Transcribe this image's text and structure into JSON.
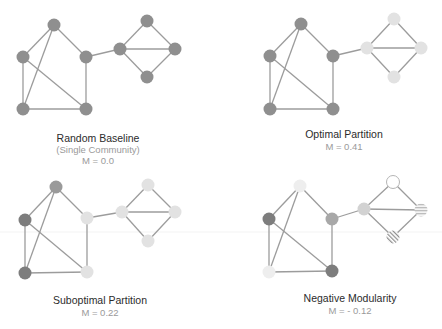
{
  "colors": {
    "edge": "#9c9c9c",
    "dark": "#7d7d7d",
    "base": "#8f8f8f",
    "medium": "#a8a8a8",
    "light": "#dcdcdc",
    "pale": "#ececec",
    "white": "#ffffff"
  },
  "panels": [
    {
      "id": "random-baseline",
      "title": "Random Baseline",
      "subtitle": "(Single Community)",
      "metric": "M = 0.0",
      "label_x": 98,
      "title_y": 142,
      "subtitle_y": 153,
      "metric_y": 164,
      "nodes": [
        {
          "x": 54,
          "y": 25,
          "fill": "#8f8f8f"
        },
        {
          "x": 23,
          "y": 57,
          "fill": "#8f8f8f"
        },
        {
          "x": 86,
          "y": 57,
          "fill": "#8f8f8f"
        },
        {
          "x": 23,
          "y": 109,
          "fill": "#8f8f8f"
        },
        {
          "x": 86,
          "y": 109,
          "fill": "#8f8f8f"
        },
        {
          "x": 120,
          "y": 49,
          "fill": "#8f8f8f"
        },
        {
          "x": 147,
          "y": 21,
          "fill": "#8f8f8f"
        },
        {
          "x": 175,
          "y": 49,
          "fill": "#8f8f8f"
        },
        {
          "x": 147,
          "y": 77,
          "fill": "#8f8f8f"
        }
      ]
    },
    {
      "id": "optimal-partition",
      "title": "Optimal Partition",
      "subtitle": "",
      "metric": "M = 0.41",
      "label_x": 344,
      "title_y": 138,
      "subtitle_y": 0,
      "metric_y": 150,
      "nodes": [
        {
          "x": 301,
          "y": 24,
          "fill": "#8f8f8f"
        },
        {
          "x": 270,
          "y": 56,
          "fill": "#8f8f8f"
        },
        {
          "x": 333,
          "y": 56,
          "fill": "#8f8f8f"
        },
        {
          "x": 270,
          "y": 109,
          "fill": "#8f8f8f"
        },
        {
          "x": 333,
          "y": 109,
          "fill": "#8f8f8f"
        },
        {
          "x": 367,
          "y": 48,
          "fill": "#e2e2e2"
        },
        {
          "x": 394,
          "y": 19,
          "fill": "#e2e2e2"
        },
        {
          "x": 421,
          "y": 48,
          "fill": "#e2e2e2"
        },
        {
          "x": 394,
          "y": 77,
          "fill": "#e2e2e2"
        }
      ]
    },
    {
      "id": "suboptimal-partition",
      "title": "Suboptimal Partition",
      "subtitle": "",
      "metric": "M = 0.22",
      "label_x": 100,
      "title_y": 304,
      "subtitle_y": 0,
      "metric_y": 316,
      "nodes": [
        {
          "x": 56,
          "y": 187,
          "fill": "#9a9a9a"
        },
        {
          "x": 25,
          "y": 220,
          "fill": "#7d7d7d"
        },
        {
          "x": 87,
          "y": 218,
          "fill": "#e2e2e2"
        },
        {
          "x": 25,
          "y": 273,
          "fill": "#7d7d7d"
        },
        {
          "x": 87,
          "y": 272,
          "fill": "#e2e2e2"
        },
        {
          "x": 122,
          "y": 212,
          "fill": "#e2e2e2"
        },
        {
          "x": 148,
          "y": 185,
          "fill": "#e2e2e2"
        },
        {
          "x": 175,
          "y": 212,
          "fill": "#e2e2e2"
        },
        {
          "x": 148,
          "y": 241,
          "fill": "#e2e2e2"
        }
      ]
    },
    {
      "id": "negative-modularity",
      "title": "Negative Modularity",
      "subtitle": "",
      "metric": "M = - 0.12",
      "label_x": 350,
      "title_y": 302,
      "subtitle_y": 0,
      "metric_y": 314,
      "nodes": [
        {
          "x": 300,
          "y": 186,
          "fill": "#eeeeee",
          "pattern": "faint"
        },
        {
          "x": 269,
          "y": 219,
          "fill": "#7d7d7d"
        },
        {
          "x": 332,
          "y": 219,
          "fill": "#a8a8a8"
        },
        {
          "x": 269,
          "y": 272,
          "fill": "#eeeeee"
        },
        {
          "x": 332,
          "y": 271,
          "fill": "#7d7d7d"
        },
        {
          "x": 364,
          "y": 209,
          "fill": "#d2d2d2"
        },
        {
          "x": 393,
          "y": 182,
          "fill": "#ffffff",
          "pattern": "outline"
        },
        {
          "x": 421,
          "y": 210,
          "fill": "#dcdcdc",
          "pattern": "hstripes"
        },
        {
          "x": 393,
          "y": 237,
          "fill": "none",
          "pattern": "hatch"
        }
      ]
    }
  ],
  "edges": [
    [
      0,
      1
    ],
    [
      0,
      2
    ],
    [
      0,
      3
    ],
    [
      1,
      3
    ],
    [
      1,
      4
    ],
    [
      2,
      4
    ],
    [
      3,
      4
    ],
    [
      2,
      5
    ],
    [
      5,
      6
    ],
    [
      6,
      7
    ],
    [
      5,
      7
    ],
    [
      5,
      8
    ],
    [
      7,
      8
    ]
  ]
}
